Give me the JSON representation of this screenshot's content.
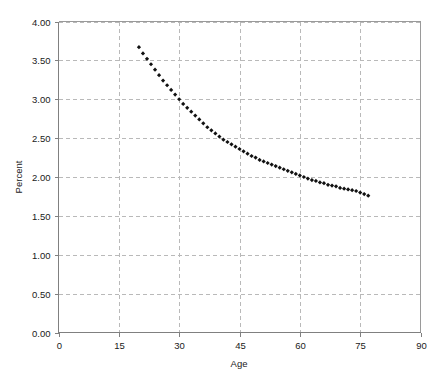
{
  "chart_data": {
    "type": "scatter",
    "title": "",
    "subtitle": "",
    "xlabel": "Age",
    "ylabel": "Percent",
    "xlim": [
      0,
      90
    ],
    "ylim": [
      0,
      4.0
    ],
    "grid": true,
    "legend": null,
    "legend_position": "none",
    "marker_style": "filled-diamond",
    "marker_color": "#111111",
    "grid_color": "#b9b9b9",
    "axis_color": "#808080",
    "x_ticks": [
      0,
      15,
      30,
      45,
      60,
      75,
      90
    ],
    "x_tick_labels": [
      "0",
      "15",
      "30",
      "45",
      "60",
      "75",
      "90"
    ],
    "y_ticks": [
      0.0,
      0.5,
      1.0,
      1.5,
      2.0,
      2.5,
      3.0,
      3.5,
      4.0
    ],
    "y_tick_labels": [
      "0.00",
      "0.50",
      "1.00",
      "1.50",
      "2.00",
      "2.50",
      "3.00",
      "3.50",
      "4.00"
    ],
    "series": [
      {
        "name": "Percent by Age",
        "x": [
          20,
          21,
          22,
          23,
          24,
          25,
          26,
          27,
          28,
          29,
          30,
          31,
          32,
          33,
          34,
          35,
          36,
          37,
          38,
          39,
          40,
          41,
          42,
          43,
          44,
          45,
          46,
          47,
          48,
          49,
          50,
          51,
          52,
          53,
          54,
          55,
          56,
          57,
          58,
          59,
          60,
          61,
          62,
          63,
          64,
          65,
          66,
          67,
          68,
          69,
          70,
          71,
          72,
          73,
          74,
          75,
          76,
          77
        ],
        "y": [
          3.67,
          3.59,
          3.52,
          3.45,
          3.38,
          3.31,
          3.24,
          3.18,
          3.12,
          3.06,
          3.0,
          2.94,
          2.89,
          2.84,
          2.79,
          2.74,
          2.69,
          2.64,
          2.6,
          2.56,
          2.52,
          2.48,
          2.45,
          2.42,
          2.39,
          2.36,
          2.33,
          2.3,
          2.27,
          2.25,
          2.22,
          2.2,
          2.18,
          2.16,
          2.14,
          2.12,
          2.1,
          2.08,
          2.06,
          2.04,
          2.02,
          2.0,
          1.98,
          1.96,
          1.95,
          1.93,
          1.92,
          1.9,
          1.89,
          1.88,
          1.86,
          1.85,
          1.84,
          1.83,
          1.82,
          1.8,
          1.78,
          1.76
        ]
      }
    ]
  },
  "axes": {
    "x_title": "Age",
    "y_title": "Percent"
  }
}
